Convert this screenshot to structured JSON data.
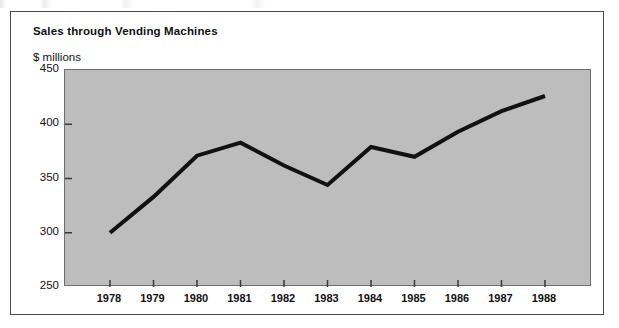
{
  "figure": {
    "title": "Sales through Vending Machines",
    "unit_label": "$ millions"
  },
  "chart_data": {
    "type": "line",
    "title": "Sales through Vending Machines",
    "subtitle": "$ millions",
    "xlabel": "",
    "ylabel": "$ millions",
    "categories": [
      "1978",
      "1979",
      "1980",
      "1981",
      "1982",
      "1983",
      "1984",
      "1985",
      "1986",
      "1987",
      "1988"
    ],
    "values": [
      300,
      333,
      371,
      383,
      362,
      344,
      379,
      370,
      393,
      412,
      426
    ],
    "series": [
      {
        "name": "Sales through Vending Machines",
        "values": [
          300,
          333,
          371,
          383,
          362,
          344,
          379,
          370,
          393,
          412,
          426
        ]
      }
    ],
    "ylim": [
      250,
      450
    ],
    "y_ticks": [
      "250",
      "300",
      "350",
      "400",
      "450"
    ],
    "y_tick_values": [
      250,
      300,
      350,
      400,
      450
    ],
    "x_ticks": [
      "1978",
      "1979",
      "1980",
      "1981",
      "1982",
      "1983",
      "1984",
      "1985",
      "1986",
      "1987",
      "1988"
    ],
    "grid": false,
    "legend": false,
    "legend_position": "none",
    "plot_background_color": "#bdbdbd",
    "line_color": "#111111",
    "line_width_px": 4
  }
}
